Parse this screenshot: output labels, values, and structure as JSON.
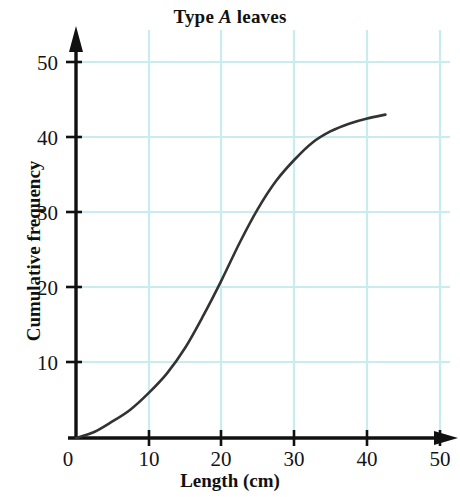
{
  "chart_data": {
    "type": "line",
    "title": "Type A leaves",
    "title_parts": {
      "prefix": "Type ",
      "italic": "A",
      "suffix": " leaves"
    },
    "xlabel": "Length (cm)",
    "ylabel": "Cumulative frequency",
    "xlim": [
      0,
      50
    ],
    "ylim": [
      0,
      50
    ],
    "xticks": [
      0,
      10,
      20,
      30,
      40,
      50
    ],
    "yticks": [
      0,
      10,
      20,
      30,
      40,
      50
    ],
    "xtick_labels": [
      "0",
      "10",
      "20",
      "30",
      "40",
      "50"
    ],
    "ytick_labels": [
      "0",
      "10",
      "20",
      "30",
      "40",
      "50"
    ],
    "grid": true,
    "grid_color": "#c9ecee",
    "legend": null,
    "curve_color": "#333333",
    "axis_color": "#000000",
    "series": [
      {
        "name": "Cumulative frequency",
        "x": [
          0,
          2.5,
          5,
          7.5,
          10,
          12.5,
          15,
          17.5,
          20,
          22.5,
          25,
          27.5,
          30,
          32.5,
          35,
          37.5,
          40,
          42.5
        ],
        "y": [
          0,
          0.8,
          2.2,
          3.8,
          6.0,
          8.6,
          12.0,
          16.3,
          21.0,
          26.0,
          30.5,
          34.2,
          37.0,
          39.3,
          40.8,
          41.8,
          42.5,
          43.0
        ]
      }
    ]
  },
  "axes": {
    "x_tick_labels": [
      "0",
      "10",
      "20",
      "30",
      "40",
      "50"
    ],
    "y_tick_labels": [
      "0",
      "10",
      "20",
      "30",
      "40",
      "50"
    ]
  }
}
